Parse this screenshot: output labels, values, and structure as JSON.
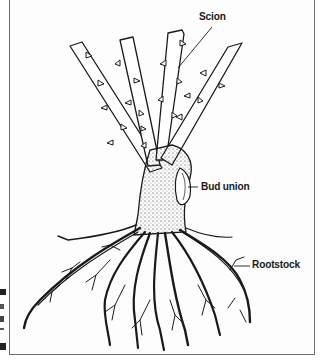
{
  "figure": {
    "labels": {
      "scion": "Scion",
      "bud_union": "Bud union",
      "rootstock": "Rootstock"
    },
    "colors": {
      "ink": "#1a1a1a",
      "frame": "#6e6e6e",
      "background": "#fdfdfd"
    },
    "parts": [
      "canes",
      "thorns",
      "bud union",
      "roots"
    ],
    "cane_count": 4
  }
}
